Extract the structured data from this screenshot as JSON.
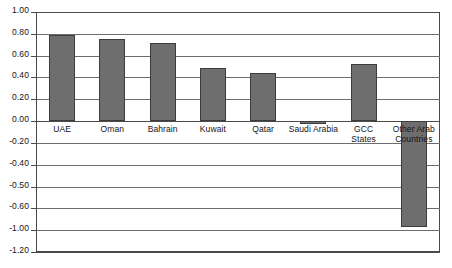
{
  "chart_data": {
    "type": "bar",
    "title": "",
    "subtitle": "",
    "xlabel": "",
    "ylabel": "",
    "categories": [
      "UAE",
      "Oman",
      "Bahrain",
      "Kuwait",
      "Qatar",
      "Saudi Arabia",
      "GCC\nStates",
      "Other Arab\nCountries"
    ],
    "values": [
      0.79,
      0.75,
      0.72,
      0.49,
      0.44,
      -0.03,
      0.52,
      -0.95
    ],
    "series": [
      {
        "name": "",
        "values": [
          0.79,
          0.75,
          0.72,
          0.49,
          0.44,
          -0.03,
          0.52,
          -0.95
        ]
      }
    ],
    "ylim": [
      -1.2,
      1.0
    ],
    "ytick_labels": [
      "1.00",
      "0.80",
      "0.60",
      "0.40",
      "0.20",
      "0.00",
      "-0.20",
      "-0.40",
      "-0.50",
      "-0.60",
      "-1.00",
      "-1.20"
    ],
    "ytick_values": [
      1.0,
      0.8,
      0.6,
      0.4,
      0.2,
      0.0,
      -0.2,
      -0.4,
      -0.5,
      -0.6,
      -1.0,
      -1.2
    ],
    "grid": true,
    "legend": "none",
    "bar_color": "#6e6e6e",
    "bar_border_color": "#3d3d3d",
    "gridline_color": "#6d6d6d",
    "axis_color": "#4a4a4a",
    "background": "#ffffff"
  }
}
